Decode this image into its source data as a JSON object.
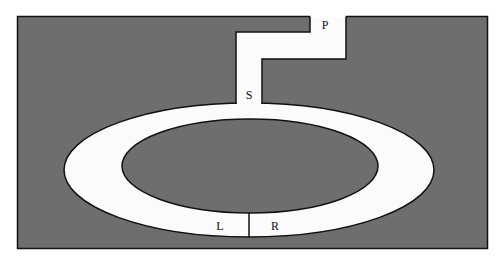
{
  "diagram": {
    "type": "track-layout",
    "colors": {
      "background": "#ffffff",
      "ground": "#6e6e6e",
      "track": "#fbfbfb",
      "outline": "#111111"
    },
    "labels": {
      "p": "P",
      "s": "S",
      "l": "L",
      "r": "R"
    }
  }
}
